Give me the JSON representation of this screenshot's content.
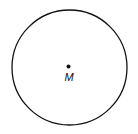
{
  "diagram": {
    "type": "circle-with-center",
    "circle": {
      "cx": 69.5,
      "cy": 67.5,
      "r": 57.5,
      "stroke": "#111111"
    },
    "center_point": {
      "x": 68.5,
      "y": 66.5,
      "r": 2,
      "label": "M"
    }
  }
}
